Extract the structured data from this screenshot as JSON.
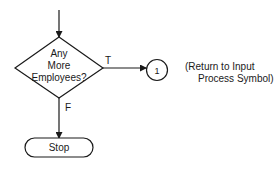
{
  "diagram": {
    "type": "flowchart",
    "nodes": [
      {
        "id": "decision",
        "shape": "diamond",
        "lines": [
          "Any",
          "More",
          "Employees?"
        ]
      },
      {
        "id": "connector",
        "shape": "circle",
        "label": "1"
      },
      {
        "id": "stop",
        "shape": "terminator",
        "label": "Stop"
      }
    ],
    "edges": [
      {
        "from": "entry",
        "to": "decision",
        "label": ""
      },
      {
        "from": "decision",
        "to": "connector",
        "label": "T"
      },
      {
        "from": "decision",
        "to": "stop",
        "label": "F"
      }
    ],
    "annotation": {
      "line1": "(Return to Input",
      "line2": "Process Symbol)"
    },
    "colors": {
      "stroke": "#1a1a1a",
      "background": "#ffffff"
    }
  }
}
